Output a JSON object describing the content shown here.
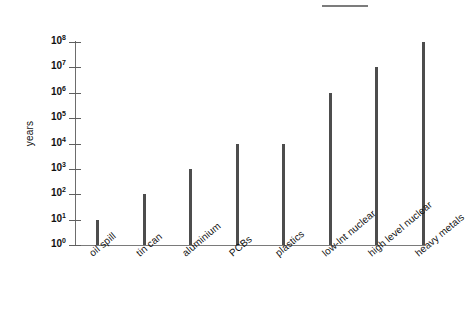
{
  "artifact": {
    "top_dash_name": "scan-artifact-dash"
  },
  "chart_data": {
    "type": "bar",
    "title": "",
    "xlabel": "",
    "ylabel": "years",
    "yscale": "log",
    "ylim": [
      1,
      100000000
    ],
    "grid": false,
    "legend": "none",
    "categories": [
      "oil spill",
      "tin can",
      "aluminium",
      "PCBs",
      "plastics",
      "low-lnt nuclear",
      "high level nuclear",
      "heavy metals"
    ],
    "values": [
      10,
      100,
      1000,
      10000,
      10000,
      1000000,
      10000000,
      100000000
    ],
    "ytick_labels": [
      "10⁰",
      "10¹",
      "10²",
      "10³",
      "10⁴",
      "10⁵",
      "10⁶",
      "10⁷",
      "10⁸"
    ],
    "ytick_bases": [
      "10",
      "10",
      "10",
      "10",
      "10",
      "10",
      "10",
      "10",
      "10"
    ],
    "ytick_exponents": [
      "0",
      "1",
      "2",
      "3",
      "4",
      "5",
      "6",
      "7",
      "8"
    ],
    "ytick_values": [
      1,
      10,
      100,
      1000,
      10000,
      100000,
      1000000,
      10000000,
      100000000
    ],
    "bar_color": "#4d4d4d",
    "axis_color": "#6d6d6d"
  }
}
